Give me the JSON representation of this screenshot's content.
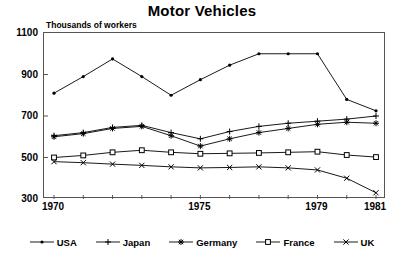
{
  "chart_data": {
    "type": "line",
    "title": "Motor Vehicles",
    "subtitle": "Thousands of workers",
    "xlabel": "",
    "ylabel": "Thousands of workers",
    "x": [
      1970,
      1971,
      1972,
      1973,
      1974,
      1975,
      1976,
      1977,
      1978,
      1979,
      1980,
      1981
    ],
    "xtick_labels": [
      "1970",
      "1975",
      "1979",
      "1981"
    ],
    "xtick_values": [
      1970,
      1975,
      1979,
      1981
    ],
    "xlim": [
      1970,
      1981
    ],
    "ytick_labels": [
      "300",
      "500",
      "700",
      "900",
      "1100"
    ],
    "ytick_values": [
      300,
      500,
      700,
      900,
      1100
    ],
    "ylim": [
      300,
      1100
    ],
    "grid": false,
    "legend_position": "bottom",
    "series": [
      {
        "name": "USA",
        "marker": "filled-circle",
        "color": "#000000",
        "values": [
          810,
          890,
          975,
          890,
          800,
          875,
          945,
          1000,
          1000,
          1000,
          780,
          725
        ]
      },
      {
        "name": "Japan",
        "marker": "plus",
        "color": "#000000",
        "values": [
          605,
          620,
          645,
          655,
          620,
          590,
          625,
          650,
          665,
          675,
          685,
          700
        ]
      },
      {
        "name": "Germany",
        "marker": "asterisk",
        "color": "#000000",
        "values": [
          600,
          615,
          640,
          650,
          605,
          555,
          590,
          620,
          640,
          660,
          670,
          665
        ]
      },
      {
        "name": "France",
        "marker": "open-square",
        "color": "#000000",
        "values": [
          500,
          510,
          525,
          535,
          525,
          518,
          520,
          522,
          525,
          528,
          512,
          502
        ]
      },
      {
        "name": "UK",
        "marker": "cross",
        "color": "#000000",
        "values": [
          480,
          475,
          468,
          462,
          455,
          450,
          452,
          455,
          450,
          440,
          400,
          330
        ]
      }
    ]
  },
  "legend": {
    "items": [
      {
        "label": "USA",
        "marker": "filled-circle"
      },
      {
        "label": "Japan",
        "marker": "plus"
      },
      {
        "label": "Germany",
        "marker": "asterisk"
      },
      {
        "label": "France",
        "marker": "open-square"
      },
      {
        "label": "UK",
        "marker": "cross"
      }
    ]
  },
  "colors": {
    "ink": "#000000",
    "frame": "#555555",
    "background": "#ffffff"
  }
}
